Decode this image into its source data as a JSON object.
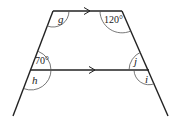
{
  "diagram": {
    "type": "geometry-parallel-lines",
    "colors": {
      "line": "#222222",
      "arc": "#555555",
      "background": "#ffffff"
    },
    "labels": {
      "g": "g",
      "angle_top_right": "120°",
      "angle_mid_left": "70°",
      "h": "h",
      "j": "j",
      "i": "i"
    },
    "parallel_marks": {
      "top": "arrow-right",
      "middle": "arrow-right"
    }
  }
}
